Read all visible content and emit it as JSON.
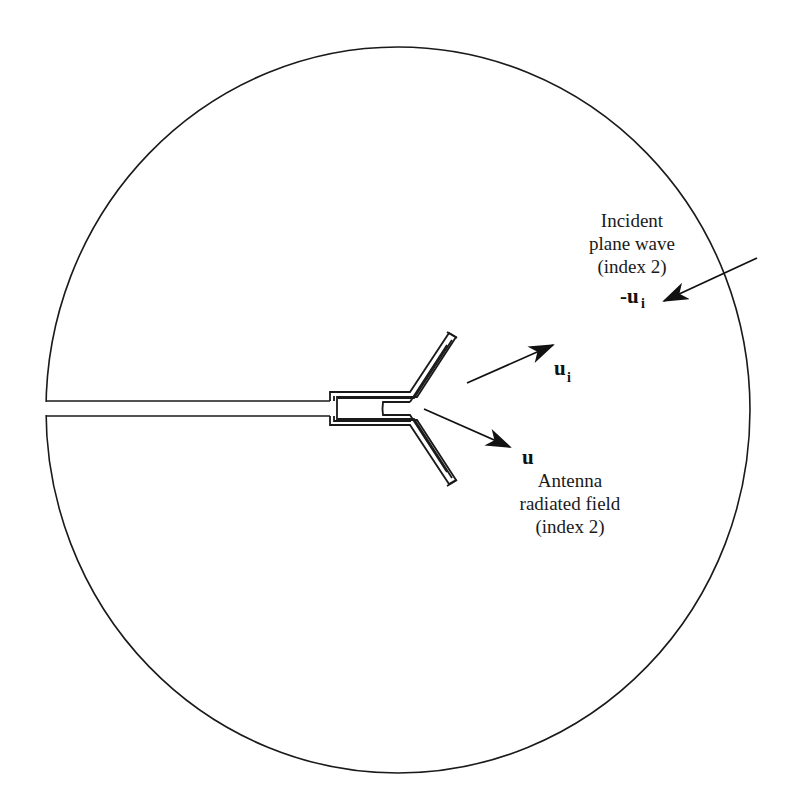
{
  "figure": {
    "type": "antenna-scattering-diagram",
    "colors": {
      "line": "#1a1a1a",
      "background": "#ffffff"
    },
    "boundary": {
      "shape": "circle",
      "cx": 398,
      "cy": 410,
      "rx": 352,
      "ry": 363
    }
  },
  "labels": {
    "incident": {
      "line1": "Incident",
      "line2": "plane wave",
      "line3": "(index 2)"
    },
    "neg_ui": {
      "prefix": "-u",
      "subscript": "i"
    },
    "ui": {
      "base": "u",
      "subscript": "i"
    },
    "u": {
      "base": "u"
    },
    "radiated": {
      "line1": "Antenna",
      "line2": "radiated field",
      "line3": "(index 2)"
    }
  },
  "arrows": [
    {
      "name": "incident-wave-arrow",
      "from": [
        757,
        258
      ],
      "to": [
        662,
        302
      ]
    },
    {
      "name": "ui-arrow",
      "from": [
        467,
        383
      ],
      "to": [
        552,
        345
      ]
    },
    {
      "name": "u-arrow",
      "from": [
        424,
        409
      ],
      "to": [
        508,
        445
      ]
    }
  ]
}
